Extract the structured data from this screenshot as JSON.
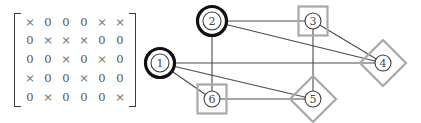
{
  "figure": {
    "width": 421,
    "height": 123
  },
  "matrix": {
    "rows": 5,
    "cols": 6,
    "nonzero_symbol": "×",
    "zero_symbol": "0",
    "bracket_style": "square",
    "values": [
      [
        "×",
        "0",
        "0",
        "0",
        "×",
        "×"
      ],
      [
        "0",
        "×",
        "×",
        "×",
        "0",
        "0"
      ],
      [
        "0",
        "0",
        "×",
        "0",
        "×",
        "0"
      ],
      [
        "×",
        "0",
        "0",
        "×",
        "0",
        "0"
      ],
      [
        "0",
        "×",
        "0",
        "0",
        "0",
        "×"
      ]
    ]
  },
  "graph": {
    "nodes": [
      {
        "id": "1",
        "label": "1",
        "x": 160,
        "y": 63,
        "decoration": "ring",
        "radius": 11
      },
      {
        "id": "2",
        "label": "2",
        "x": 212,
        "y": 21,
        "decoration": "ring",
        "radius": 11
      },
      {
        "id": "3",
        "label": "3",
        "x": 313,
        "y": 21,
        "decoration": "square",
        "radius": 10
      },
      {
        "id": "4",
        "label": "4",
        "x": 383,
        "y": 63,
        "decoration": "diamond",
        "radius": 10
      },
      {
        "id": "5",
        "label": "5",
        "x": 313,
        "y": 99,
        "decoration": "diamond",
        "radius": 10
      },
      {
        "id": "6",
        "label": "6",
        "x": 212,
        "y": 99,
        "decoration": "square",
        "radius": 10
      }
    ],
    "edges": [
      {
        "source": "1",
        "target": "4"
      },
      {
        "source": "1",
        "target": "5"
      },
      {
        "source": "1",
        "target": "6"
      },
      {
        "source": "2",
        "target": "3"
      },
      {
        "source": "2",
        "target": "4"
      },
      {
        "source": "2",
        "target": "6"
      },
      {
        "source": "3",
        "target": "4"
      },
      {
        "source": "3",
        "target": "5"
      },
      {
        "source": "5",
        "target": "6"
      }
    ],
    "colors": {
      "edge": "#4a4a4a",
      "ring": "#111111",
      "square": "#a8a8a8",
      "diamond": "#a8a8a8",
      "node_fill": "#ffffff",
      "node_stroke": "#3d3d3d",
      "label": "#4a4a4a"
    }
  }
}
